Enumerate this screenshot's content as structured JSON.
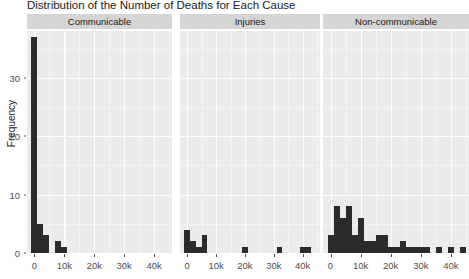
{
  "chart_data": {
    "type": "bar",
    "title": "Distribution of the Number of Deaths for Each Cause",
    "xlabel": "",
    "ylabel": "Frequency",
    "ylim": [
      0,
      38
    ],
    "xlim": [
      -2500,
      46000
    ],
    "grid": true,
    "legend": null,
    "facet_labels": [
      "Communicable",
      "Injuries",
      "Non-communicable"
    ],
    "y_ticks": [
      0,
      10,
      20,
      30
    ],
    "y_tick_labels": [
      "0",
      "10",
      "20",
      "30"
    ],
    "x_ticks": [
      0,
      10000,
      20000,
      30000,
      40000
    ],
    "x_tick_labels": [
      "0",
      "10k",
      "20k",
      "30k",
      "40k"
    ],
    "bin_width": 2000,
    "panels": [
      {
        "name": "Communicable",
        "bin_starts": [
          0,
          2000,
          4000,
          6000,
          8000,
          10000
        ],
        "values": [
          37,
          5,
          3,
          0,
          2,
          1
        ]
      },
      {
        "name": "Injuries",
        "bin_starts": [
          0,
          2000,
          4000,
          6000,
          18000,
          20000,
          30000,
          32000,
          40000,
          42000
        ],
        "values": [
          4,
          2,
          1,
          3,
          0,
          1,
          0,
          1,
          1,
          1
        ]
      },
      {
        "name": "Non-communicable",
        "bin_starts": [
          0,
          2000,
          4000,
          6000,
          8000,
          10000,
          12000,
          14000,
          16000,
          18000,
          20000,
          22000,
          24000,
          26000,
          28000,
          30000,
          32000,
          34000,
          36000,
          38000,
          40000,
          42000,
          44000
        ],
        "values": [
          3,
          8,
          6,
          8,
          3,
          6,
          2,
          2,
          3,
          3,
          1,
          1,
          2,
          1,
          1,
          1,
          1,
          0,
          1,
          0,
          1,
          0,
          1
        ]
      }
    ],
    "colors": {
      "bar": "#2b2b2b",
      "panel_background": "#ebebeb",
      "strip_background": "#d5d5d5",
      "gridline": "#ffffff",
      "text": "#1a1a1a",
      "tick_text": "#4d4d4d"
    }
  }
}
